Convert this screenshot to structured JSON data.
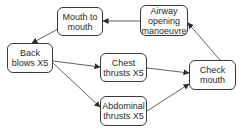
{
  "diagram": {
    "type": "flowchart",
    "nodes": [
      {
        "id": "mouth_to_mouth",
        "lines": [
          "Mouth to",
          "mouth"
        ]
      },
      {
        "id": "airway_opening",
        "lines": [
          "Airway",
          "opening",
          "manoeuvre"
        ]
      },
      {
        "id": "back_blows",
        "lines": [
          "Back",
          "blows X5"
        ]
      },
      {
        "id": "chest_thrusts",
        "lines": [
          "Chest",
          "thrusts X5"
        ]
      },
      {
        "id": "abdominal_thrusts",
        "lines": [
          "Abdominal",
          "thrusts X5"
        ]
      },
      {
        "id": "check_mouth",
        "lines": [
          "Check",
          "mouth"
        ]
      }
    ],
    "edges": [
      {
        "from": "back_blows",
        "to": "chest_thrusts"
      },
      {
        "from": "back_blows",
        "to": "abdominal_thrusts"
      },
      {
        "from": "chest_thrusts",
        "to": "check_mouth"
      },
      {
        "from": "abdominal_thrusts",
        "to": "check_mouth"
      },
      {
        "from": "check_mouth",
        "to": "airway_opening"
      },
      {
        "from": "airway_opening",
        "to": "mouth_to_mouth"
      },
      {
        "from": "mouth_to_mouth",
        "to": "back_blows"
      }
    ],
    "colors": {
      "stroke": "#3a3a3a",
      "text": "#2a2a2a",
      "background": "#ffffff"
    }
  }
}
